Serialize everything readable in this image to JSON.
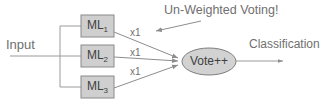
{
  "diagram": {
    "title_annotation": "Un-Weighted Voting!",
    "input_label": "Input",
    "output_label": "Classification",
    "colors": {
      "background": "#ffffff",
      "box_fill": "#cfcfcf",
      "box_stroke": "#8a8a8a",
      "ellipse_fill": "#d2d2d2",
      "ellipse_stroke": "#7e7e7e",
      "wire": "#9a9a9a",
      "text": "#6f6f6f"
    },
    "models": [
      {
        "name": "ML",
        "subscript": "1",
        "weight": "x1"
      },
      {
        "name": "ML",
        "subscript": "2",
        "weight": "x1"
      },
      {
        "name": "ML",
        "subscript": "3",
        "weight": "x1"
      }
    ],
    "aggregator": {
      "label": "Vote++",
      "shape": "ellipse"
    },
    "icons": {
      "input_arrow": "arrow-right-icon",
      "output_arrow": "arrow-right-icon",
      "annotation_arrow": "arrow-down-left-icon"
    }
  }
}
